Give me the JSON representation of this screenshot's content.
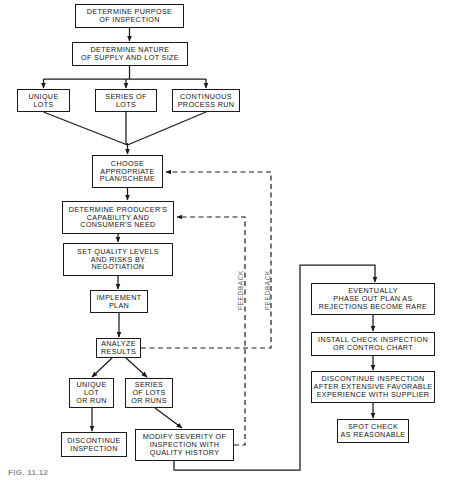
{
  "figure": {
    "caption": "FIG. 11.12",
    "stroke_color": "#1b1b1b",
    "background_color": "#ffffff",
    "text_color": "#161616",
    "feedback_label_color": "#5c5c5c"
  },
  "nodes": {
    "determine_purpose": {
      "lines": [
        "DETERMINE PURPOSE",
        "OF INSPECTION"
      ],
      "x": 75,
      "y": 4,
      "w": 109,
      "h": 24,
      "font": 7.2
    },
    "determine_nature": {
      "lines": [
        "DETERMINE NATURE",
        "OF SUPPLY AND LOT SIZE"
      ],
      "x": 72,
      "y": 42,
      "w": 116,
      "h": 24,
      "font": 7.2
    },
    "unique_lots": {
      "lines": [
        "UNIQUE",
        "LOTS"
      ],
      "x": 17,
      "y": 89,
      "w": 53,
      "h": 23,
      "font": 7.2
    },
    "series_of_lots": {
      "lines": [
        "SERIES  OF",
        "LOTS"
      ],
      "x": 95,
      "y": 89,
      "w": 62,
      "h": 23,
      "font": 7.2
    },
    "continuous_process_run": {
      "lines": [
        "CONTINUOUS",
        "PROCESS RUN"
      ],
      "x": 172,
      "y": 89,
      "w": 68,
      "h": 23,
      "font": 7.2
    },
    "choose_plan": {
      "lines": [
        "CHOOSE",
        "APPROPRIATE",
        "PLAN/SCHEME"
      ],
      "x": 92,
      "y": 155,
      "w": 71,
      "h": 33,
      "font": 7.2
    },
    "determine_capability": {
      "lines": [
        "DETERMINE PRODUCER'S",
        "CAPABILITY AND",
        "CONSUMER'S NEED"
      ],
      "x": 62,
      "y": 201,
      "w": 112,
      "h": 33,
      "font": 7.2
    },
    "set_quality_levels": {
      "lines": [
        "SET QUALITY LEVELS",
        "AND RISKS BY",
        "NEGOTIATION"
      ],
      "x": 63,
      "y": 243,
      "w": 110,
      "h": 33,
      "font": 7.2
    },
    "implement_plan": {
      "lines": [
        "IMPLEMENT",
        "PLAN"
      ],
      "x": 90,
      "y": 290,
      "w": 58,
      "h": 23,
      "font": 7.2
    },
    "analyze_results": {
      "lines": [
        "ANALYZE",
        "RESULTS"
      ],
      "x": 96,
      "y": 338,
      "w": 45,
      "h": 20,
      "font": 7.2
    },
    "unique_lot_or_run": {
      "lines": [
        "UNIQUE",
        "LOT",
        "OR RUN"
      ],
      "x": 69,
      "y": 378,
      "w": 45,
      "h": 30,
      "font": 7.2
    },
    "series_of_lots_or_runs": {
      "lines": [
        "SERIES",
        "OF  LOTS",
        "OR  RUNS"
      ],
      "x": 125,
      "y": 378,
      "w": 48,
      "h": 30,
      "font": 7.2
    },
    "discontinue_inspection_left": {
      "lines": [
        "DISCONTINUE",
        "INSPECTION"
      ],
      "x": 61,
      "y": 432,
      "w": 66,
      "h": 25,
      "font": 7.2
    },
    "modify_severity": {
      "lines": [
        "MODIFY SEVERITY OF",
        "INSPECTION WITH",
        "QUALITY HISTORY"
      ],
      "x": 135,
      "y": 429,
      "w": 99,
      "h": 32,
      "font": 7.2
    },
    "eventually_phase_out": {
      "lines": [
        "EVENTUALLY",
        "PHASE OUT PLAN  AS",
        "REJECTIONS BECOME RARE"
      ],
      "x": 311,
      "y": 283,
      "w": 124,
      "h": 32,
      "font": 7.2
    },
    "install_check_inspection": {
      "lines": [
        "INSTALL CHECK INSPECTION",
        "OR CONTROL CHART"
      ],
      "x": 311,
      "y": 332,
      "w": 124,
      "h": 24,
      "font": 7.2
    },
    "discontinue_after_experience": {
      "lines": [
        "DISCONTINUE  INSPECTION",
        "AFTER EXTENSIVE FAVORABLE",
        "EXPERIENCE  WITH  SUPPLIER"
      ],
      "x": 311,
      "y": 371,
      "w": 124,
      "h": 32,
      "font": 7.2
    },
    "spot_check": {
      "lines": [
        "SPOT CHECK",
        "AS REASONABLE"
      ],
      "x": 337,
      "y": 419,
      "w": 72,
      "h": 24,
      "font": 7.2
    }
  },
  "feedback_labels": [
    {
      "text": "FEEDBACK",
      "x": 237,
      "y": 310,
      "font": 6.4
    },
    {
      "text": "FEEDBACK",
      "x": 264,
      "y": 310,
      "font": 6.4
    }
  ]
}
